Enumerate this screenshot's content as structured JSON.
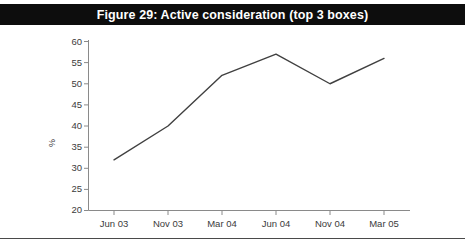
{
  "figure": {
    "title": "Figure 29: Active consideration (top 3 boxes)",
    "banner_color": "#0d0d0d",
    "banner_text_color": "#ffffff",
    "background": "#ffffff"
  },
  "chart_data": {
    "type": "line",
    "title": "Figure 29: Active consideration (top 3 boxes)",
    "categories": [
      "Jun 03",
      "Nov 03",
      "Mar 04",
      "Jun 04",
      "Nov 04",
      "Mar 05"
    ],
    "values": [
      32,
      40,
      52,
      57,
      50,
      56
    ],
    "series": [
      {
        "name": "Active consideration (top 3 boxes)",
        "values": [
          32,
          40,
          52,
          57,
          50,
          56
        ],
        "color": "#404040"
      }
    ],
    "xlabel": "",
    "ylabel": "%",
    "ylim": [
      20,
      60
    ],
    "yticks": [
      20,
      25,
      30,
      35,
      40,
      45,
      50,
      55,
      60
    ],
    "ytick_labels": [
      "20",
      "25",
      "30",
      "35",
      "40",
      "45",
      "50",
      "55",
      "60"
    ],
    "xtick_labels": [
      "Jun 03",
      "Nov 03",
      "Mar 04",
      "Jun 04",
      "Nov 04",
      "Mar 05"
    ],
    "grid": false,
    "legend": false,
    "legend_position": "none",
    "line_color": "#404040",
    "axis_color": "#8a8a8a",
    "markers": false
  }
}
